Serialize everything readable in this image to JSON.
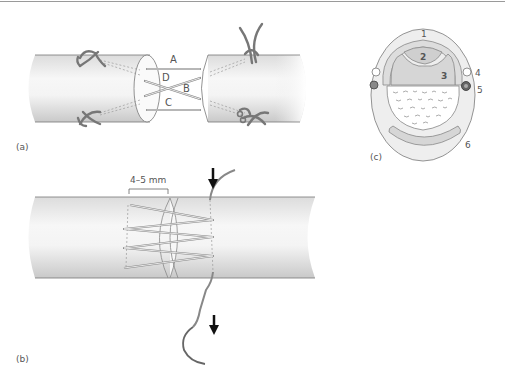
{
  "figure": {
    "panels": [
      {
        "id": "a",
        "label": "(a)"
      },
      {
        "id": "b",
        "label": "(b)"
      },
      {
        "id": "c",
        "label": "(c)"
      }
    ],
    "panel_a": {
      "suture_labels": [
        "A",
        "B",
        "C",
        "D"
      ]
    },
    "panel_b": {
      "measurement": "4–5 mm"
    },
    "panel_c": {
      "numbers": [
        "1",
        "2",
        "3",
        "4",
        "5",
        "6"
      ]
    }
  }
}
